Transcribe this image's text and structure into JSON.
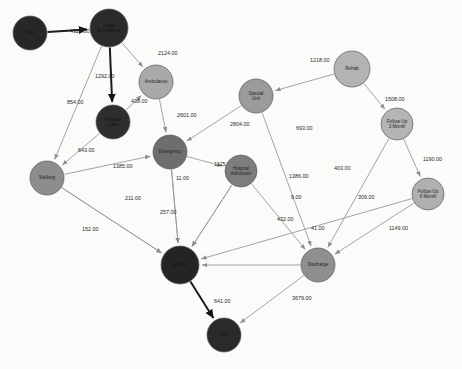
{
  "chart_data": {
    "type": "diagram",
    "subtype": "directed-weighted-network",
    "legend": null,
    "grid": false,
    "nodes": [
      {
        "id": "start",
        "label": "Start",
        "x": 30,
        "y": 33,
        "r": 17,
        "color": "#272727",
        "text_on": "dark"
      },
      {
        "id": "triage",
        "label": "Triage Emergency",
        "x": 109,
        "y": 28,
        "r": 19,
        "color": "#2b2b2b",
        "text_on": "dark"
      },
      {
        "id": "ambulance",
        "label": "Ambulance",
        "x": 156,
        "y": 82,
        "r": 17,
        "color": "#a9a9a9",
        "text_on": "light"
      },
      {
        "id": "primary_care",
        "label": "Primary Care",
        "x": 113,
        "y": 122,
        "r": 17,
        "color": "#2e2e2e",
        "text_on": "dark"
      },
      {
        "id": "walking",
        "label": "Walking",
        "x": 47,
        "y": 178,
        "r": 17,
        "color": "#8d8d8d",
        "text_on": "light"
      },
      {
        "id": "emergency",
        "label": "Emergency",
        "x": 170,
        "y": 152,
        "r": 17,
        "color": "#6e6e6e",
        "text_on": "light"
      },
      {
        "id": "special_unit",
        "label": "Special Unit",
        "x": 256,
        "y": 96,
        "r": 17,
        "color": "#9b9b9b",
        "text_on": "light"
      },
      {
        "id": "hospital_adm",
        "label": "Hospital Admission",
        "x": 241,
        "y": 171,
        "r": 16,
        "color": "#7d7d7d",
        "text_on": "light"
      },
      {
        "id": "rehab",
        "label": "Rehab",
        "x": 352,
        "y": 69,
        "r": 18,
        "color": "#b3b3b3",
        "text_on": "light"
      },
      {
        "id": "follow3",
        "label": "Follow Up 3 Month",
        "x": 397,
        "y": 124,
        "r": 16,
        "color": "#b5b5b5",
        "text_on": "light"
      },
      {
        "id": "follow6",
        "label": "Follow Up 6 Month",
        "x": 428,
        "y": 194,
        "r": 16,
        "color": "#b0b0b0",
        "text_on": "light"
      },
      {
        "id": "discharge",
        "label": "Discharge",
        "x": 318,
        "y": 265,
        "r": 17,
        "color": "#8f8f8f",
        "text_on": "light"
      },
      {
        "id": "exitus",
        "label": "Exitus",
        "x": 180,
        "y": 265,
        "r": 19,
        "color": "#242424",
        "text_on": "dark"
      },
      {
        "id": "end",
        "label": "End",
        "x": 224,
        "y": 335,
        "r": 17,
        "color": "#2a2a2a",
        "text_on": "dark"
      }
    ],
    "edges": [
      {
        "source": "start",
        "target": "triage",
        "weight": 4326.0,
        "label": "4326.00",
        "lx": 70,
        "ly": 33,
        "strong": true
      },
      {
        "source": "triage",
        "target": "ambulance",
        "weight": 2124.0,
        "label": "2124.00",
        "lx": 158,
        "ly": 55,
        "strong": false
      },
      {
        "source": "triage",
        "target": "primary_care",
        "weight": 1292.0,
        "label": "1292.00",
        "lx": 95,
        "ly": 78,
        "strong": true
      },
      {
        "source": "triage",
        "target": "walking",
        "weight": 854.0,
        "label": "854.00",
        "lx": 67,
        "ly": 104,
        "strong": false
      },
      {
        "source": "primary_care",
        "target": "ambulance",
        "weight": 438.0,
        "label": "438.00",
        "lx": 131,
        "ly": 103,
        "strong": false
      },
      {
        "source": "primary_care",
        "target": "walking",
        "weight": 643.0,
        "label": "643.00",
        "lx": 78,
        "ly": 152,
        "strong": false
      },
      {
        "source": "ambulance",
        "target": "emergency",
        "weight": 2601.0,
        "label": "2601.00",
        "lx": 177,
        "ly": 117,
        "strong": false
      },
      {
        "source": "walking",
        "target": "emergency",
        "weight": 1385.0,
        "label": "1385.00",
        "lx": 113,
        "ly": 168,
        "strong": false
      },
      {
        "source": "emergency",
        "target": "hospital_adm",
        "weight": 1125.0,
        "label": "1125.00",
        "lx": 214,
        "ly": 166,
        "strong": false
      },
      {
        "source": "emergency",
        "target": "exitus",
        "weight": 11.0,
        "label": "11.00",
        "lx": 176,
        "ly": 180,
        "strong": false
      },
      {
        "source": "walking",
        "target": "exitus",
        "weight": 211.0,
        "label": "211.00",
        "lx": 125,
        "ly": 200,
        "strong": false
      },
      {
        "source": "walking",
        "target": "exitus",
        "weight": 152.0,
        "label": "152.00",
        "lx": 82,
        "ly": 231,
        "strong": false
      },
      {
        "source": "emergency",
        "target": "exitus",
        "weight": 257.0,
        "label": "257.00",
        "lx": 160,
        "ly": 214,
        "strong": false
      },
      {
        "source": "special_unit",
        "target": "emergency",
        "weight": 2804.0,
        "label": "2804.00",
        "lx": 230,
        "ly": 126,
        "strong": false
      },
      {
        "source": "rehab",
        "target": "special_unit",
        "weight": 1218.0,
        "label": "1218.00",
        "lx": 310,
        "ly": 62,
        "strong": false
      },
      {
        "source": "rehab",
        "target": "follow3",
        "weight": 1508.0,
        "label": "1508.00",
        "lx": 385,
        "ly": 101,
        "strong": false
      },
      {
        "source": "special_unit",
        "target": "discharge",
        "weight": 693.0,
        "label": "693.00",
        "lx": 296,
        "ly": 130,
        "strong": false
      },
      {
        "source": "hospital_adm",
        "target": "discharge",
        "weight": 1386.0,
        "label": "1386.00",
        "lx": 289,
        "ly": 178,
        "strong": false
      },
      {
        "source": "follow3",
        "target": "discharge",
        "weight": 403.0,
        "label": "403.00",
        "lx": 334,
        "ly": 170,
        "strong": false
      },
      {
        "source": "follow3",
        "target": "follow6",
        "weight": 1190.0,
        "label": "1190.00",
        "lx": 423,
        "ly": 161,
        "strong": false
      },
      {
        "source": "hospital_adm",
        "target": "exitus",
        "weight": 9.0,
        "label": "9.00",
        "lx": 291,
        "ly": 199,
        "strong": false
      },
      {
        "source": "follow6",
        "target": "discharge",
        "weight": 309.0,
        "label": "309.00",
        "lx": 358,
        "ly": 199,
        "strong": false
      },
      {
        "source": "hospital_adm",
        "target": "exitus",
        "weight": 432.0,
        "label": "432.00",
        "lx": 277,
        "ly": 221,
        "strong": false
      },
      {
        "source": "discharge",
        "target": "exitus",
        "weight": 41.0,
        "label": "41.00",
        "lx": 311,
        "ly": 230,
        "strong": false
      },
      {
        "source": "follow6",
        "target": "exitus",
        "weight": 1149.0,
        "label": "1149.00",
        "lx": 389,
        "ly": 230,
        "strong": false
      },
      {
        "source": "exitus",
        "target": "end",
        "weight": 641.0,
        "label": "641.00",
        "lx": 214,
        "ly": 303,
        "strong": true
      },
      {
        "source": "discharge",
        "target": "end",
        "weight": 3679.0,
        "label": "3679.00",
        "lx": 292,
        "ly": 300,
        "strong": false
      }
    ],
    "edge_count": 27,
    "node_count": 14
  }
}
